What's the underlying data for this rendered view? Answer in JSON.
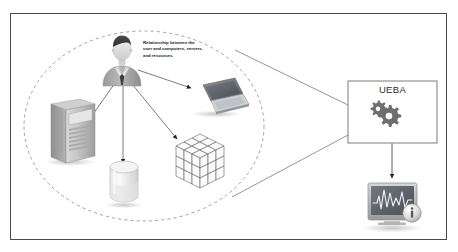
{
  "diagram": {
    "background_color": "#ffffff",
    "frame": {
      "border_color": "#4a4a4a",
      "fill": "#ffffff"
    },
    "annotation": {
      "name": "relationship-note",
      "lines": [
        "Relationship between the",
        "user and computers, servers,",
        "and resources."
      ],
      "text": "Relationship between the user and computers, servers, and resources.",
      "color": "#1c1c1c"
    },
    "grouping": {
      "name": "user-environment-ellipse",
      "style": "dashed",
      "stroke_color": "#8a8a8a"
    },
    "nodes": [
      {
        "id": "user",
        "label": "User",
        "icon": "user-avatar-icon",
        "x": 122,
        "y": 62
      },
      {
        "id": "server",
        "label": "Server",
        "icon": "server-tower-icon",
        "x": 70,
        "y": 130
      },
      {
        "id": "database",
        "label": "Database",
        "icon": "database-icon",
        "x": 125,
        "y": 180
      },
      {
        "id": "cube",
        "label": "Resources",
        "icon": "resource-cube-icon",
        "x": 190,
        "y": 160
      },
      {
        "id": "laptop",
        "label": "Computer",
        "icon": "laptop-icon",
        "x": 215,
        "y": 95
      }
    ],
    "edges": [
      {
        "from": "user",
        "to": "server",
        "style": "arrow"
      },
      {
        "from": "user",
        "to": "database",
        "style": "arrow"
      },
      {
        "from": "user",
        "to": "cube",
        "style": "arrow"
      },
      {
        "from": "user",
        "to": "laptop",
        "style": "arrow"
      },
      {
        "from": "ueba",
        "to": "monitor",
        "style": "arrow"
      }
    ],
    "ueba_box": {
      "name": "ueba-box",
      "label": "UEBA",
      "icon": "gears-icon",
      "border_color": "#6f6f6f",
      "fill": "#ffffff",
      "label_color": "#2b2b2b"
    },
    "funnel": {
      "name": "ueba-funnel-connector",
      "stroke_color": "#7a7a7a"
    },
    "monitor": {
      "name": "analytics-monitor",
      "icon": "monitor-waveform-icon",
      "badge_icon": "info-badge-icon",
      "screen_color": "#4e5256",
      "waveform_color": "#f2f2f2"
    }
  }
}
